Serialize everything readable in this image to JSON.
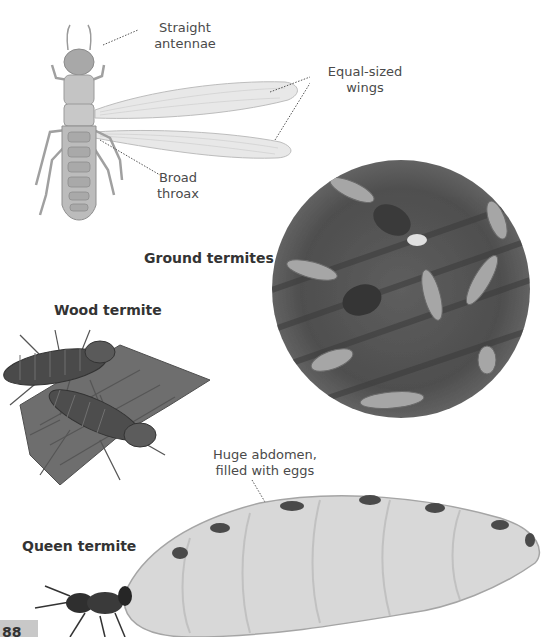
{
  "page": {
    "page_number": "88"
  },
  "winged_termite": {
    "labels": {
      "antennae": [
        "Straight",
        "antennae"
      ],
      "wings": [
        "Equal-sized",
        "wings"
      ],
      "thorax": [
        "Broad",
        "throax"
      ]
    }
  },
  "ground_termites": {
    "heading": "Ground termites"
  },
  "wood_termite": {
    "heading": "Wood termite"
  },
  "queen_termite": {
    "heading": "Queen termite",
    "label": [
      "Huge abdomen,",
      "filled with eggs"
    ]
  },
  "colors": {
    "text": "#333333",
    "label_text": "#4a4a4a",
    "page_tab": "#c8c8c8"
  }
}
